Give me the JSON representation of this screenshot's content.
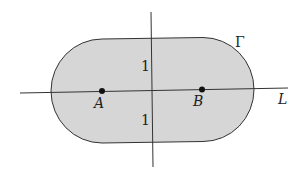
{
  "diagram": {
    "region": {
      "label": "Γ",
      "fill": "#d6d6d6",
      "stroke": "#333333"
    },
    "line": {
      "label": "L"
    },
    "points": [
      {
        "label": "A"
      },
      {
        "label": "B"
      }
    ],
    "distance_labels": [
      {
        "label": "1"
      },
      {
        "label": "1"
      }
    ]
  }
}
